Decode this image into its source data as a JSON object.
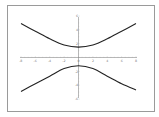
{
  "chart_data": {
    "type": "line",
    "title": "",
    "xlabel": "",
    "ylabel": "",
    "xlim": [
      -8,
      8
    ],
    "ylim": [
      -6,
      6
    ],
    "grid": false,
    "legend": null,
    "x_ticks": [
      -8,
      -6,
      -4,
      -2,
      0,
      2,
      4,
      6,
      8
    ],
    "x_tick_labels": [
      "-8",
      "-6",
      "-4",
      "-2",
      "0",
      "2",
      "4",
      "6",
      "8"
    ],
    "y_ticks": [
      -6,
      -4,
      -2,
      2,
      4,
      6
    ],
    "y_tick_labels": [
      "-6",
      "-4",
      "-2",
      "2",
      "4",
      "6"
    ],
    "series": [
      {
        "name": "upper branch",
        "x": [
          -8,
          -6,
          -4,
          -2,
          0,
          2,
          4,
          6,
          8
        ],
        "values": [
          4.9,
          3.8,
          2.7,
          1.8,
          1.5,
          1.8,
          2.7,
          3.8,
          4.9
        ]
      },
      {
        "name": "lower branch",
        "x": [
          -8,
          -6,
          -4,
          -2,
          0,
          2,
          4,
          6,
          8
        ],
        "values": [
          -4.9,
          -3.8,
          -2.7,
          -1.6,
          -1.2,
          -1.6,
          -2.7,
          -3.8,
          -4.7
        ]
      }
    ],
    "line_color": "#222222"
  }
}
